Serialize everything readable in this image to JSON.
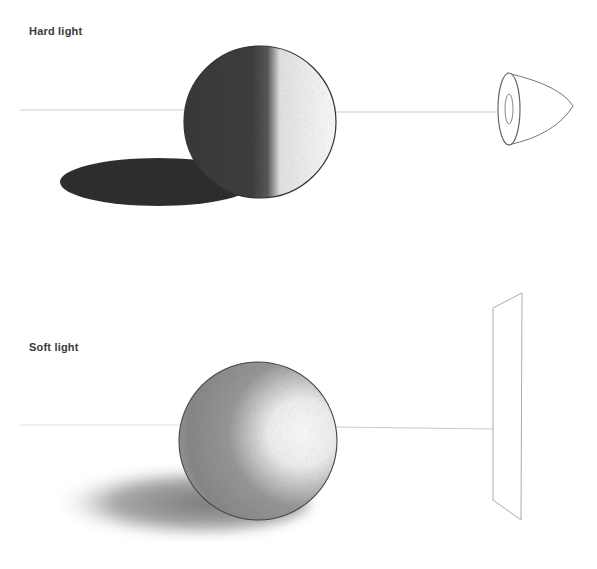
{
  "illustrations": [
    {
      "title": "Hard light",
      "light_source": "spotlight-cone",
      "description": "Sphere lit by a small cone light source; sharp terminator and dark, crisp cast shadow"
    },
    {
      "title": "Soft light",
      "light_source": "flat-panel",
      "description": "Sphere lit by a large flat panel light source; gradual shading and soft, diffuse cast shadow"
    }
  ],
  "colors": {
    "background": "#ffffff",
    "text": "#3a3a3a",
    "hard_shadow": "#2e2e2e",
    "soft_shadow": "#8a8a8a",
    "line": "#c8c8c8"
  }
}
